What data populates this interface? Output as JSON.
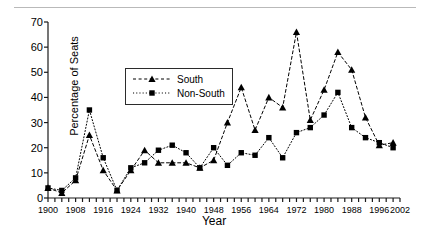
{
  "figure": {
    "xlabel": "Year",
    "ylabel": "Percentage of Seats"
  },
  "legend": {
    "items": [
      {
        "label": "South",
        "marker": "triangle-marker",
        "dash": "dashed"
      },
      {
        "label": "Non-South",
        "marker": "square-marker",
        "dash": "dotted"
      }
    ]
  },
  "chart_data": {
    "type": "line",
    "title": "",
    "xlabel": "Year",
    "ylabel": "Percentage of Seats",
    "xlim": [
      1900,
      2002
    ],
    "ylim": [
      0,
      70
    ],
    "xticks": [
      1900,
      1908,
      1916,
      1924,
      1932,
      1940,
      1948,
      1956,
      1964,
      1972,
      1980,
      1988,
      1996,
      2002
    ],
    "yticks": [
      0,
      10,
      20,
      30,
      40,
      50,
      60,
      70
    ],
    "xtick_interval": 2,
    "grid": false,
    "legend_position": "upper-left-inside",
    "x": [
      1900,
      1904,
      1908,
      1912,
      1916,
      1920,
      1924,
      1928,
      1932,
      1936,
      1940,
      1944,
      1948,
      1952,
      1956,
      1960,
      1964,
      1968,
      1972,
      1976,
      1980,
      1984,
      1988,
      1992,
      1996,
      2000
    ],
    "series": [
      {
        "name": "South",
        "marker": "triangle",
        "linestyle": "dashed",
        "color": "#000000",
        "values": [
          4,
          2,
          7,
          25,
          11,
          3,
          11,
          19,
          14,
          14,
          14,
          12,
          15,
          30,
          44,
          27,
          40,
          36,
          66,
          31,
          43,
          58,
          51,
          32,
          21,
          22
        ]
      },
      {
        "name": "Non-South",
        "marker": "square",
        "linestyle": "dotted",
        "color": "#000000",
        "values": [
          4,
          3,
          8,
          35,
          16,
          3,
          12,
          14,
          19,
          21,
          18,
          12,
          20,
          13,
          18,
          17,
          24,
          16,
          26,
          28,
          33,
          42,
          28,
          24,
          22,
          20
        ]
      }
    ]
  }
}
